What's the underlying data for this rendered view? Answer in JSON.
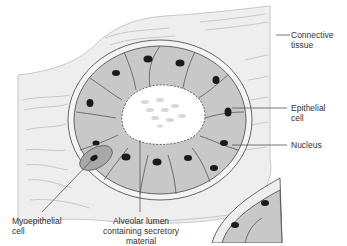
{
  "diagram": {
    "labels": [
      {
        "id": "connective-tissue",
        "text": "Connective\ntissue"
      },
      {
        "id": "epithelial-cell",
        "text": "Epithelial\ncell"
      },
      {
        "id": "nucleus",
        "text": "Nucleus"
      },
      {
        "id": "myoepithelial-cell",
        "text": "Myoepithelial\ncell"
      },
      {
        "id": "alveolar-lumen",
        "text": "Alveolar lumen\ncontaining secretory\nmaterial"
      }
    ],
    "colors": {
      "connective_tissue": "#eeeeee",
      "cell_fill": "#c8c8c8",
      "nucleus": "#1a1a1a",
      "lumen": "#ffffff",
      "outline": "#555555",
      "leader_line": "#555555"
    }
  }
}
